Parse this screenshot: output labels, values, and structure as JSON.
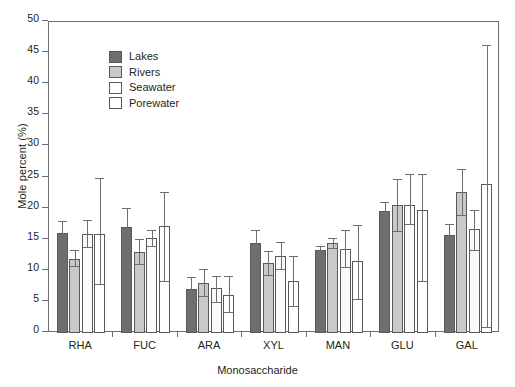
{
  "chart_data": {
    "type": "bar",
    "title": "",
    "xlabel": "Monosaccharide",
    "ylabel": "Mole percent (%)",
    "categories": [
      "RHA",
      "FUC",
      "ARA",
      "XYL",
      "MAN",
      "GLU",
      "GAL"
    ],
    "ylim": [
      0,
      50
    ],
    "yticks": [
      0,
      5,
      10,
      15,
      20,
      25,
      30,
      35,
      40,
      45,
      50
    ],
    "grid": false,
    "legend_position": "top-left",
    "series": [
      {
        "name": "Lakes",
        "color": "#6e6e6e",
        "values": [
          16.0,
          17.0,
          7.1,
          14.4,
          13.4,
          19.6,
          15.8
        ],
        "err_low": [
          14.0,
          14.1,
          5.3,
          12.5,
          12.9,
          17.8,
          13.5
        ],
        "err_high": [
          18.0,
          20.1,
          9.0,
          16.5,
          14.0,
          21.0,
          17.5
        ]
      },
      {
        "name": "Rivers",
        "color": "#c9c9c9",
        "values": [
          11.9,
          13.1,
          8.1,
          11.2,
          14.4,
          20.6,
          22.6
        ],
        "err_low": [
          10.8,
          11.1,
          6.0,
          9.3,
          13.6,
          16.4,
          18.9
        ],
        "err_high": [
          13.3,
          15.1,
          10.3,
          13.2,
          15.2,
          24.8,
          26.4
        ]
      },
      {
        "name": "Seawater",
        "color": "#fafafa",
        "values": [
          15.9,
          15.2,
          7.2,
          12.4,
          13.5,
          20.6,
          16.7
        ],
        "err_low": [
          13.9,
          14.0,
          5.0,
          10.3,
          10.6,
          17.5,
          13.3
        ],
        "err_high": [
          18.1,
          16.5,
          9.2,
          14.6,
          16.6,
          25.5,
          19.8
        ]
      },
      {
        "name": "Porewater",
        "color": "#ffffff",
        "values": [
          15.9,
          17.2,
          6.1,
          8.3,
          11.5,
          19.7,
          23.9
        ],
        "err_low": [
          7.9,
          8.3,
          3.3,
          4.3,
          5.5,
          8.4,
          1.0
        ],
        "err_high": [
          25.0,
          22.6,
          9.2,
          12.3,
          17.3,
          25.6,
          46.3
        ]
      }
    ]
  },
  "legend": {
    "items": [
      {
        "label": "Lakes"
      },
      {
        "label": "Rivers"
      },
      {
        "label": "Seawater"
      },
      {
        "label": "Porewater"
      }
    ]
  }
}
